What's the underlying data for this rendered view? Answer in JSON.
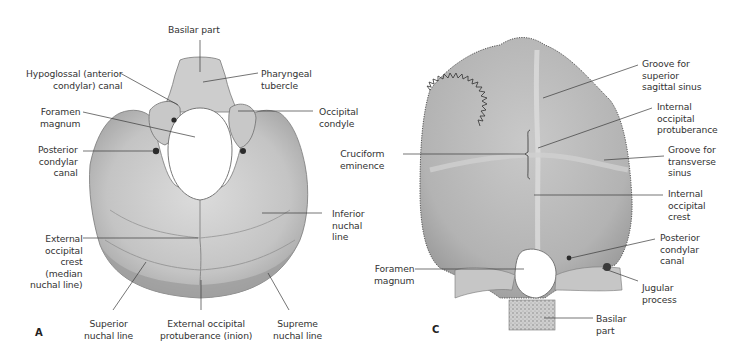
{
  "figure": {
    "panels": [
      {
        "id": "A",
        "letter": "A",
        "view": "external (inferior) view of occipital bone",
        "labels": [
          {
            "key": "basilar_part",
            "text": "Basilar part"
          },
          {
            "key": "hypoglossal_canal",
            "text": "Hypoglossal (anterior\ncondylar) canal"
          },
          {
            "key": "pharyngeal_tubercle",
            "text": "Pharyngeal\ntubercle"
          },
          {
            "key": "foramen_magnum",
            "text": "Foramen\nmagnum"
          },
          {
            "key": "occipital_condyle",
            "text": "Occipital\ncondyle"
          },
          {
            "key": "posterior_condylar_canal",
            "text": "Posterior\ncondylar\ncanal"
          },
          {
            "key": "inferior_nuchal_line",
            "text": "Inferior\nnuchal\nline"
          },
          {
            "key": "external_occipital_crest",
            "text": "External\noccipital\ncrest\n(median\nnuchal line)"
          },
          {
            "key": "superior_nuchal_line",
            "text": "Superior\nnuchal line"
          },
          {
            "key": "external_occipital_protuberance",
            "text": "External occipital\nprotuberance (inion)"
          },
          {
            "key": "supreme_nuchal_line",
            "text": "Supreme\nnuchal line"
          }
        ]
      },
      {
        "id": "C",
        "letter": "C",
        "view": "internal view of occipital bone",
        "labels": [
          {
            "key": "groove_superior_sagittal_sinus",
            "text": "Groove for\nsuperior\nsagittal sinus"
          },
          {
            "key": "internal_occipital_protuberance",
            "text": "Internal\noccipital\nprotuberance"
          },
          {
            "key": "cruciform_eminence",
            "text": "Cruciform\neminence"
          },
          {
            "key": "groove_transverse_sinus",
            "text": "Groove for\ntransverse\nsinus"
          },
          {
            "key": "internal_occipital_crest",
            "text": "Internal\noccipital\ncrest"
          },
          {
            "key": "posterior_condylar_canal",
            "text": "Posterior\ncondylar\ncanal"
          },
          {
            "key": "foramen_magnum",
            "text": "Foramen\nmagnum"
          },
          {
            "key": "jugular_process",
            "text": "Jugular\nprocess"
          },
          {
            "key": "basilar_part",
            "text": "Basilar\npart"
          }
        ]
      }
    ],
    "colors": {
      "background": "#ffffff",
      "bone_light": "#d9d9d9",
      "bone_mid": "#bdbdbd",
      "bone_dark": "#8c8c8c",
      "leader_line": "#3a3a3a",
      "text": "#333333"
    }
  }
}
